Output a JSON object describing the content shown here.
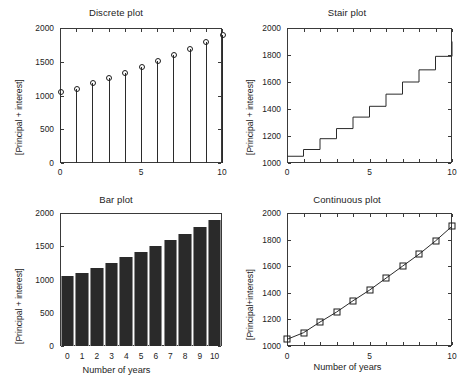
{
  "figure": {
    "background": "#ffffff",
    "ink": "#232323"
  },
  "chart_data": [
    {
      "id": "discrete",
      "type": "scatter",
      "marker": "open-circle-stem",
      "title": "Discrete plot",
      "xlabel": "",
      "ylabel": "[Principal + interest]",
      "x": [
        0,
        1,
        2,
        3,
        4,
        5,
        6,
        7,
        8,
        9,
        10
      ],
      "values": [
        1050,
        1100,
        1180,
        1255,
        1340,
        1420,
        1510,
        1600,
        1690,
        1790,
        1900
      ],
      "xlim": [
        0,
        10
      ],
      "ylim": [
        0,
        2000
      ],
      "xticks": [
        0,
        5,
        10
      ],
      "xticklabels": [
        "0",
        "5",
        "10"
      ],
      "xminorticks": [
        0,
        1,
        2,
        3,
        4,
        5,
        6,
        7,
        8,
        9,
        10
      ],
      "yticks": [
        0,
        500,
        1000,
        1500,
        2000
      ],
      "yticklabels": [
        "0",
        "500",
        "1000",
        "1500",
        "2000"
      ],
      "grid": false,
      "box": true
    },
    {
      "id": "stair",
      "type": "line",
      "drawstyle": "steps-post",
      "title": "Stair plot",
      "xlabel": "",
      "ylabel": "[Principal + interest]",
      "x": [
        0,
        1,
        2,
        3,
        4,
        5,
        6,
        7,
        8,
        9,
        10
      ],
      "values": [
        1050,
        1100,
        1180,
        1255,
        1340,
        1420,
        1510,
        1600,
        1690,
        1790,
        1900
      ],
      "xlim": [
        0,
        10
      ],
      "ylim": [
        1000,
        2000
      ],
      "xticks": [
        0,
        5,
        10
      ],
      "xticklabels": [
        "0",
        "5",
        "10"
      ],
      "yticks": [
        1000,
        1200,
        1400,
        1600,
        1800,
        2000
      ],
      "yticklabels": [
        "1000",
        "1200",
        "1400",
        "1600",
        "1800",
        "2000"
      ],
      "grid": false,
      "box": true
    },
    {
      "id": "bar",
      "type": "bar",
      "title": "Bar plot",
      "xlabel": "Number of years",
      "ylabel": "[Principal + interest]",
      "categories": [
        "0",
        "1",
        "2",
        "3",
        "4",
        "5",
        "6",
        "7",
        "8",
        "9",
        "10"
      ],
      "values": [
        1050,
        1100,
        1180,
        1255,
        1340,
        1420,
        1510,
        1600,
        1690,
        1790,
        1900
      ],
      "bar_color": "#2a2a2a",
      "bar_edge_color": "#8d8d8d",
      "xlim": [
        -0.5,
        10.5
      ],
      "ylim": [
        0,
        2000
      ],
      "yticks": [
        0,
        500,
        1000,
        1500,
        2000
      ],
      "yticklabels": [
        "0",
        "500",
        "1000",
        "1500",
        "2000"
      ],
      "grid": false,
      "box": true
    },
    {
      "id": "continuous",
      "type": "line",
      "marker": "open-square",
      "title": "Continuous plot",
      "xlabel": "Number of years",
      "ylabel": "[Principal+interest]",
      "x": [
        0,
        1,
        2,
        3,
        4,
        5,
        6,
        7,
        8,
        9,
        10
      ],
      "values": [
        1050,
        1100,
        1180,
        1255,
        1340,
        1420,
        1510,
        1600,
        1690,
        1790,
        1900
      ],
      "xlim": [
        0,
        10
      ],
      "ylim": [
        1000,
        2000
      ],
      "xticks": [
        0,
        5,
        10
      ],
      "xticklabels": [
        "0",
        "5",
        "10"
      ],
      "yticks": [
        1000,
        1200,
        1400,
        1600,
        1800,
        2000
      ],
      "yticklabels": [
        "1000",
        "1200",
        "1400",
        "1600",
        "1800",
        "2000"
      ],
      "grid": false,
      "box": true
    }
  ]
}
